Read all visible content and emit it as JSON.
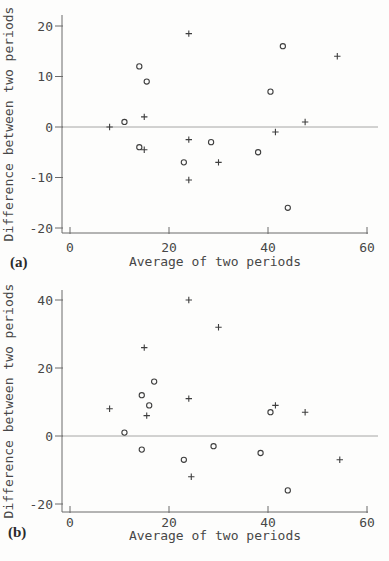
{
  "figure": {
    "background": "#fdfdfc",
    "ink_color": "#3e3e3e",
    "zero_line_color": "#9c9c9c"
  },
  "chart_data": [
    {
      "type": "scatter",
      "panel_label": "(a)",
      "xlabel": "Average of two periods",
      "ylabel": "Difference between two periods",
      "xlim": [
        0,
        60
      ],
      "ylim": [
        -20,
        20
      ],
      "xticks": [
        0,
        20,
        40,
        60
      ],
      "yticks": [
        -20,
        -10,
        0,
        10,
        20
      ],
      "refline_y": 0,
      "grid": false,
      "legend": "none",
      "series": [
        {
          "name": "circle-marker-series",
          "marker": "o",
          "points": [
            [
              11,
              1
            ],
            [
              14,
              12
            ],
            [
              15.5,
              9
            ],
            [
              14,
              -4
            ],
            [
              23,
              -7
            ],
            [
              28.5,
              -3
            ],
            [
              38,
              -5
            ],
            [
              40.5,
              7
            ],
            [
              43,
              16
            ],
            [
              44,
              -16
            ]
          ]
        },
        {
          "name": "plus-marker-series",
          "marker": "+",
          "points": [
            [
              8,
              0
            ],
            [
              15,
              2
            ],
            [
              15,
              -4.5
            ],
            [
              24,
              18.5
            ],
            [
              24,
              -2.5
            ],
            [
              24,
              -10.5
            ],
            [
              30,
              -7
            ],
            [
              41.5,
              -1
            ],
            [
              47.5,
              1
            ],
            [
              54,
              14
            ]
          ]
        }
      ]
    },
    {
      "type": "scatter",
      "panel_label": "(b)",
      "xlabel": "Average of two periods",
      "ylabel": "Difference between two periods",
      "xlim": [
        0,
        60
      ],
      "ylim": [
        -20,
        40
      ],
      "xticks": [
        0,
        20,
        40,
        60
      ],
      "yticks": [
        -20,
        0,
        20,
        40
      ],
      "refline_y": 0,
      "grid": false,
      "legend": "none",
      "series": [
        {
          "name": "circle-marker-series",
          "marker": "o",
          "points": [
            [
              11,
              1
            ],
            [
              14.5,
              12
            ],
            [
              16,
              9
            ],
            [
              17,
              16
            ],
            [
              14.5,
              -4
            ],
            [
              23,
              -7
            ],
            [
              29,
              -3
            ],
            [
              38.5,
              -5
            ],
            [
              40.5,
              7
            ],
            [
              44,
              -16
            ]
          ]
        },
        {
          "name": "plus-marker-series",
          "marker": "+",
          "points": [
            [
              8,
              8
            ],
            [
              15,
              26
            ],
            [
              15.5,
              6
            ],
            [
              24,
              40
            ],
            [
              24,
              11
            ],
            [
              24.5,
              -12
            ],
            [
              30,
              32
            ],
            [
              41.5,
              9
            ],
            [
              47.5,
              7
            ],
            [
              54.5,
              -7
            ]
          ]
        }
      ]
    }
  ]
}
